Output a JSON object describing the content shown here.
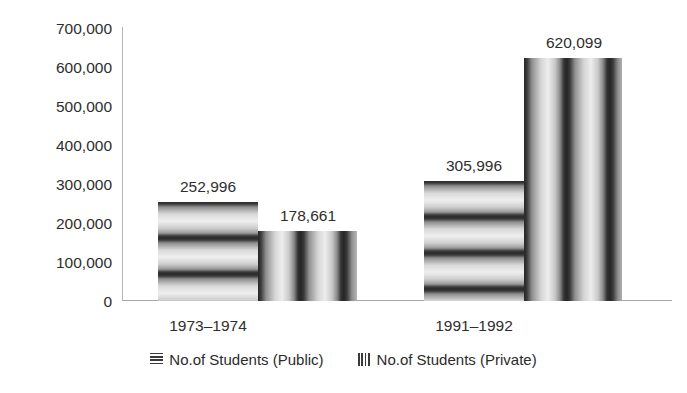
{
  "chart_data": {
    "type": "bar",
    "title": "",
    "subtitle": "",
    "xlabel": "",
    "ylabel": "",
    "categories": [
      "1973–1974",
      "1991–1992"
    ],
    "series": [
      {
        "name": "No.of Students (Public)",
        "pattern": "horizontal-stripes",
        "values": [
          252996,
          305996
        ],
        "value_labels": [
          "252,996",
          "305,996"
        ]
      },
      {
        "name": "No.of Students (Private)",
        "pattern": "vertical-stripes",
        "values": [
          178661,
          620099
        ],
        "value_labels": [
          "178,661",
          "620,099"
        ]
      }
    ],
    "ylim": [
      0,
      700000
    ],
    "ytick_step": 100000,
    "ytick_labels": [
      "700,000",
      "600,000",
      "500,000",
      "400,000",
      "300,000",
      "200,000",
      "100,000",
      "0"
    ],
    "ytick_values": [
      700000,
      600000,
      500000,
      400000,
      300000,
      200000,
      100000,
      0
    ],
    "grid": false,
    "legend_position": "bottom",
    "colors": {
      "axis": "#b4b4b4",
      "text": "#2b2b2b",
      "background": "#ffffff",
      "pattern_dark": "#2a2a2a",
      "pattern_light": "#efefef"
    }
  },
  "legend": {
    "items": [
      {
        "label": "No.of Students (Public)",
        "swatch": "horizontal-stripes-swatch"
      },
      {
        "label": "No.of Students (Private)",
        "swatch": "vertical-stripes-swatch"
      }
    ]
  }
}
